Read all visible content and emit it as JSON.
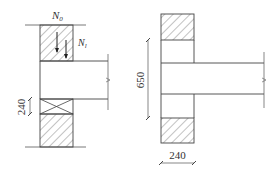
{
  "left_view": {
    "label_top": "N",
    "label_top_sub": "0",
    "label_side": "N",
    "label_side_sub": "l",
    "dim_vertical": "240"
  },
  "right_view": {
    "dim_vertical": "650",
    "dim_horizontal": "240"
  },
  "colors": {
    "line": "#444444",
    "hatch": "#666666",
    "background": "#ffffff"
  }
}
